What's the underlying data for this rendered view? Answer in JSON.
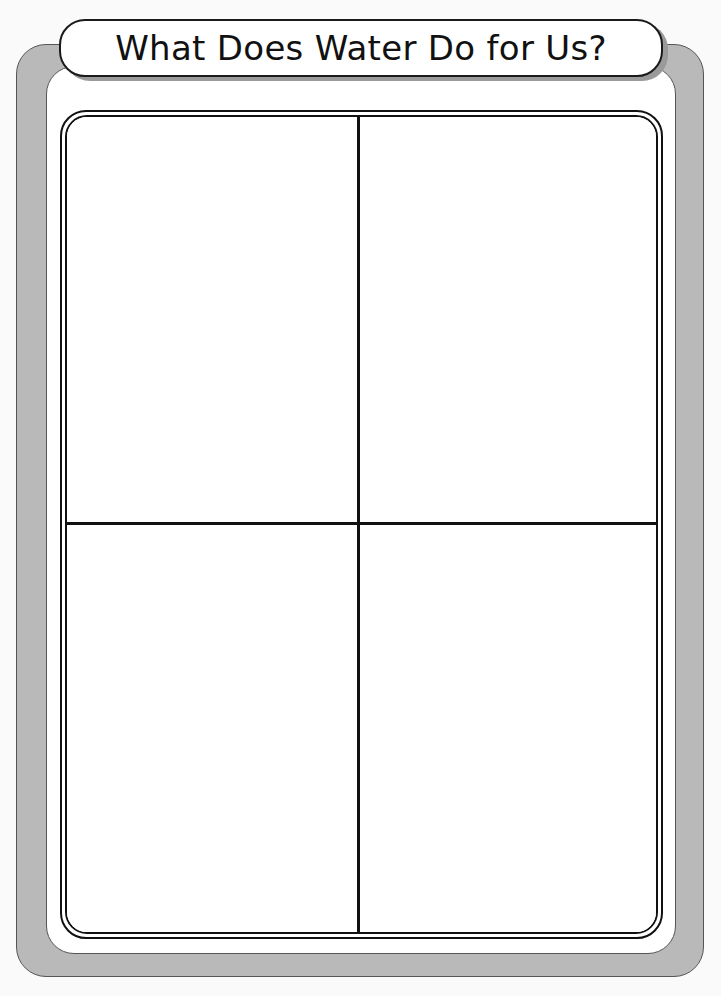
{
  "worksheet": {
    "title": "What Does Water Do for Us?",
    "layout": "2x2 graphic organizer",
    "quadrants": [
      {
        "position": "top-left",
        "content": ""
      },
      {
        "position": "top-right",
        "content": ""
      },
      {
        "position": "bottom-left",
        "content": ""
      },
      {
        "position": "bottom-right",
        "content": ""
      }
    ]
  },
  "colors": {
    "frame_gray": "#b9b9b9",
    "panel_white": "#ffffff",
    "line_black": "#111111",
    "shadow_gray": "#9a9a9a"
  }
}
